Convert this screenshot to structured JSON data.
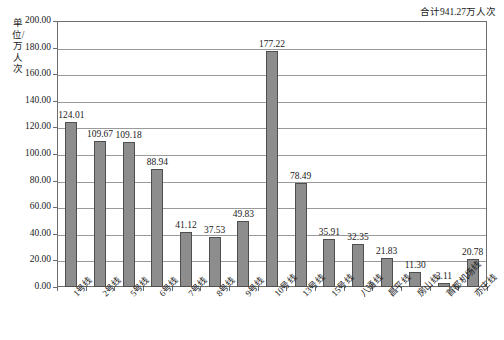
{
  "annotation": {
    "total_text": "合计941.27万人次"
  },
  "axis": {
    "y_title": "单位/万人次",
    "y_ticks": [
      "0.00",
      "20.00",
      "40.00",
      "60.00",
      "80.00",
      "100.00",
      "120.00",
      "140.00",
      "160.00",
      "180.00",
      "200.00"
    ]
  },
  "colors": {
    "bar_fill": "#8d8d8d",
    "bar_border": "#4f4f4f",
    "gridline": "#9a9a9a",
    "frame": "#6e6e6e",
    "text": "#1a1a1a",
    "background": "#ffffff"
  },
  "chart_data": {
    "type": "bar",
    "title": "",
    "subtitle": "",
    "xlabel": "",
    "ylabel": "单位/万人次",
    "ylim": [
      0,
      200
    ],
    "ytick_step": 20,
    "grid": true,
    "legend": false,
    "annotations": [
      "合计941.27万人次"
    ],
    "categories": [
      "1号线",
      "2号线",
      "5号线",
      "6号线",
      "7号线",
      "8号线",
      "9号线",
      "10号线",
      "13号线",
      "15号线",
      "八通线",
      "昌平线",
      "房山线",
      "首都机场线",
      "亦庄线"
    ],
    "values": [
      124.01,
      109.67,
      109.18,
      88.94,
      41.12,
      37.53,
      49.83,
      177.22,
      78.49,
      35.91,
      32.35,
      21.83,
      11.3,
      3.11,
      20.78
    ],
    "value_labels": [
      "124.01",
      "109.67",
      "109.18",
      "88.94",
      "41.12",
      "37.53",
      "49.83",
      "177.22",
      "78.49",
      "35.91",
      "32.35",
      "21.83",
      "11.30",
      "3.11",
      "20.78"
    ],
    "total": 941.27
  }
}
